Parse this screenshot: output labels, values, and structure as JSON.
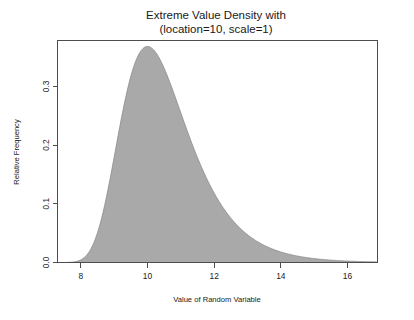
{
  "chart_data": {
    "type": "area",
    "title": "Extreme Value Density with",
    "subtitle": "(location=10, scale=1)",
    "xlabel": "Value of Random Variable",
    "ylabel": "Relative Frequency",
    "xlim": [
      7.3,
      16.9
    ],
    "ylim": [
      0.0,
      0.378
    ],
    "grid": false,
    "legend": null,
    "distribution": "gumbel",
    "location": 10,
    "scale": 1,
    "fill_color": "#a9a9a9",
    "line_color": "#8a8a8a",
    "peak": {
      "x": 10,
      "y": 0.3679
    },
    "xticks": [
      8,
      10,
      12,
      14,
      16
    ],
    "xtick_labels": [
      "8",
      "10",
      "12",
      "14",
      "16"
    ],
    "yticks": [
      0.0,
      0.1,
      0.2,
      0.3
    ],
    "ytick_labels": [
      "0.0",
      "0.1",
      "0.2",
      "0.3"
    ],
    "x": [
      7.3,
      7.5,
      7.7,
      7.9,
      8.1,
      8.3,
      8.5,
      8.7,
      8.9,
      9.1,
      9.3,
      9.5,
      9.7,
      9.9,
      10.0,
      10.1,
      10.3,
      10.5,
      10.7,
      10.9,
      11.1,
      11.3,
      11.5,
      11.7,
      11.9,
      12.1,
      12.3,
      12.5,
      12.7,
      12.9,
      13.1,
      13.3,
      13.5,
      13.7,
      13.9,
      14.1,
      14.3,
      14.5,
      14.7,
      14.9,
      15.1,
      15.3,
      15.5,
      15.7,
      15.9,
      16.1,
      16.3,
      16.5,
      16.7,
      16.9
    ],
    "y": [
      0.0033,
      0.0073,
      0.0143,
      0.0253,
      0.041,
      0.0617,
      0.0871,
      0.1161,
      0.1473,
      0.1789,
      0.2093,
      0.237,
      0.2608,
      0.28,
      0.2879,
      0.2944,
      0.3037,
      0.3079,
      0.3077,
      0.3035,
      0.2962,
      0.2864,
      0.2749,
      0.2621,
      0.2486,
      0.2348,
      0.221,
      0.2074,
      0.1942,
      0.1815,
      0.1694,
      0.1579,
      0.147,
      0.1367,
      0.127,
      0.1179,
      0.1094,
      0.1014,
      0.094,
      0.087,
      0.0805,
      0.0745,
      0.0689,
      0.0637,
      0.0588,
      0.0543,
      0.0501,
      0.0462,
      0.0426,
      0.0393
    ]
  },
  "figure": {
    "title_line1": "Extreme Value Density with",
    "title_line2": "(location=10, scale=1)",
    "x_axis_title": "Value of Random Variable",
    "y_axis_title": "Relative Frequency",
    "x_tick_labels": [
      "8",
      "10",
      "12",
      "14",
      "16"
    ],
    "y_tick_labels": [
      "0.0",
      "0.1",
      "0.2",
      "0.3"
    ]
  }
}
